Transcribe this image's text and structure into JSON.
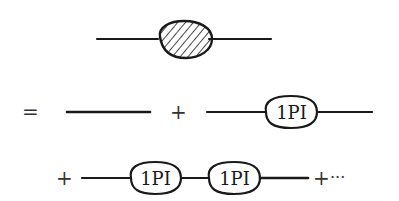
{
  "diagram": {
    "type": "feynman-diagram-series",
    "colors": {
      "ink": "#1a1a1a",
      "background": "#ffffff"
    },
    "row1": {
      "items": [
        {
          "kind": "line"
        },
        {
          "kind": "blob",
          "style": "hatched"
        },
        {
          "kind": "line"
        }
      ]
    },
    "row2": {
      "equals": "=",
      "plus": "+",
      "vertex_label": "1PI"
    },
    "row3": {
      "plus_lead": "+",
      "vertex_labels": [
        "1PI",
        "1PI"
      ],
      "plus_trail": "+",
      "ellipsis": "···"
    }
  }
}
